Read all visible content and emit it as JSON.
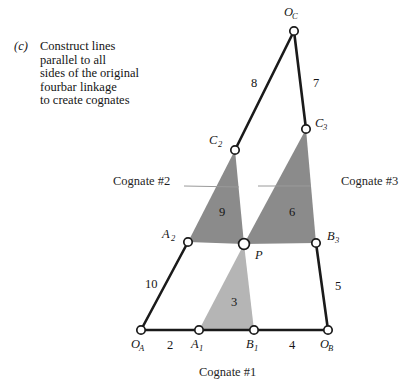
{
  "figure": {
    "part_marker": "(c)",
    "caption_lines": [
      "Construct lines",
      "parallel to all",
      "sides of the original",
      "fourbar linkage",
      "to create cognates"
    ],
    "cognate_1_label": "Cognate #1",
    "cognate_2_label": "Cognate #2",
    "cognate_3_label": "Cognate #3"
  },
  "colors": {
    "link_line": "#1a1a1a",
    "joint_fill": "#ffffff",
    "joint_stroke": "#1a1a1a",
    "triangle_dark": "#8b8b8b",
    "triangle_dark_upper": "#828282",
    "triangle_light": "#b5b5b5",
    "background": "#ffffff",
    "text": "#161616"
  },
  "joints": [
    {
      "id": "OA",
      "label": "O",
      "sub": "A",
      "x": 141,
      "y": 330,
      "label_x": 131,
      "label_y": 348,
      "sub_x": 139,
      "sub_y": 351
    },
    {
      "id": "A1",
      "label": "A",
      "sub": "1",
      "x": 199,
      "y": 330,
      "label_x": 191,
      "label_y": 348,
      "sub_x": 199,
      "sub_y": 351
    },
    {
      "id": "B1",
      "label": "B",
      "sub": "1",
      "x": 254,
      "y": 330,
      "label_x": 246,
      "label_y": 348,
      "sub_x": 254,
      "sub_y": 351
    },
    {
      "id": "OB",
      "label": "O",
      "sub": "B",
      "x": 328,
      "y": 330,
      "label_x": 320,
      "label_y": 348,
      "sub_x": 328,
      "sub_y": 351
    },
    {
      "id": "A2",
      "label": "A",
      "sub": "2",
      "x": 188,
      "y": 242,
      "label_x": 162,
      "label_y": 238,
      "sub_x": 171,
      "sub_y": 241
    },
    {
      "id": "P",
      "label": "P",
      "sub": "",
      "x": 244,
      "y": 244,
      "label_x": 255,
      "label_y": 259,
      "sub_x": 0,
      "sub_y": 0
    },
    {
      "id": "B3",
      "label": "B",
      "sub": "3",
      "x": 316,
      "y": 243,
      "label_x": 327,
      "label_y": 240,
      "sub_x": 335,
      "sub_y": 243
    },
    {
      "id": "C2",
      "label": "C",
      "sub": "2",
      "x": 235,
      "y": 150,
      "label_x": 209,
      "label_y": 144,
      "sub_x": 218,
      "sub_y": 147
    },
    {
      "id": "C3",
      "label": "C",
      "sub": "3",
      "x": 306,
      "y": 129,
      "label_x": 315,
      "label_y": 127,
      "sub_x": 323,
      "sub_y": 130
    },
    {
      "id": "OC",
      "label": "O",
      "sub": "C",
      "x": 294,
      "y": 31,
      "label_x": 284,
      "label_y": 16,
      "sub_x": 292,
      "sub_y": 19
    }
  ],
  "links": [
    {
      "name": "ground-OA-A1",
      "x1": 141,
      "y1": 330,
      "x2": 199,
      "y2": 330
    },
    {
      "name": "coupler-A1-B1",
      "x1": 199,
      "y1": 330,
      "x2": 254,
      "y2": 330
    },
    {
      "name": "ground-B1-OB",
      "x1": 254,
      "y1": 330,
      "x2": 328,
      "y2": 330
    },
    {
      "name": "crank-OA-A2",
      "x1": 141,
      "y1": 330,
      "x2": 188,
      "y2": 242
    },
    {
      "name": "rocker-OB-B3",
      "x1": 328,
      "y1": 330,
      "x2": 316,
      "y2": 243
    },
    {
      "name": "link-OC-C2",
      "x1": 294,
      "y1": 31,
      "x2": 235,
      "y2": 150
    },
    {
      "name": "link-OC-C3",
      "x1": 294,
      "y1": 31,
      "x2": 306,
      "y2": 129
    }
  ],
  "triangles": [
    {
      "name": "triangle-3",
      "points": "199,330 254,330 244,244",
      "tone": "light",
      "label": "3",
      "label_x": 231,
      "label_y": 306
    },
    {
      "name": "triangle-9",
      "points": "188,242 244,244 235,150",
      "tone": "dark",
      "label": "9",
      "label_x": 219,
      "label_y": 216
    },
    {
      "name": "triangle-6",
      "points": "244,244 316,243 306,129",
      "tone": "dark",
      "label": "6",
      "label_x": 289,
      "label_y": 216
    }
  ],
  "link_numbers": [
    {
      "name": "link-number-2",
      "value": "2",
      "x": 167,
      "y": 349
    },
    {
      "name": "link-number-4",
      "value": "4",
      "x": 289,
      "y": 349
    },
    {
      "name": "link-number-10",
      "value": "10",
      "x": 145,
      "y": 288
    },
    {
      "name": "link-number-5",
      "value": "5",
      "x": 335,
      "y": 290
    },
    {
      "name": "link-number-8",
      "value": "8",
      "x": 251,
      "y": 87
    },
    {
      "name": "link-number-7",
      "value": "7",
      "x": 313,
      "y": 87
    }
  ]
}
